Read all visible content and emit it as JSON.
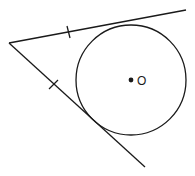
{
  "diagram": {
    "center_label": "O",
    "center_point": "filled-dot",
    "tangent_segments": 2,
    "congruence_marks": 1,
    "colors": {
      "ink": "#1a1a1a",
      "background": "#ffffff"
    }
  }
}
